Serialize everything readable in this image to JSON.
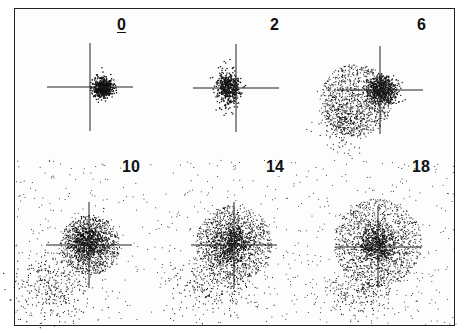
{
  "figure": {
    "panels": [
      {
        "label": "0",
        "underlined": true,
        "cx": 91,
        "cy": 80,
        "label_x": 117,
        "label_y": 22
      },
      {
        "label": "2",
        "underlined": false,
        "cx": 237,
        "cy": 81,
        "label_x": 270,
        "label_y": 22
      },
      {
        "label": "6",
        "underlined": false,
        "cx": 380,
        "cy": 82,
        "label_x": 417,
        "label_y": 22
      },
      {
        "label": "10",
        "underlined": false,
        "cx": 88,
        "cy": 243,
        "label_x": 122,
        "label_y": 164
      },
      {
        "label": "14",
        "underlined": false,
        "cx": 233,
        "cy": 245,
        "label_x": 266,
        "label_y": 164
      },
      {
        "label": "18",
        "underlined": false,
        "cx": 376,
        "cy": 247,
        "label_x": 412,
        "label_y": 164
      }
    ]
  }
}
